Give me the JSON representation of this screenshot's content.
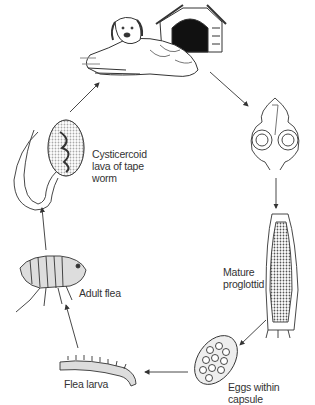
{
  "stages": {
    "dog": {
      "icon": "dog-with-kennel-icon"
    },
    "scolex": {
      "icon": "tapeworm-scolex-icon"
    },
    "proglottid": {
      "label": "Mature proglottid",
      "line1": "Mature",
      "line2": "proglottid",
      "icon": "proglottid-icon"
    },
    "eggs": {
      "label": "Eggs within capsule",
      "icon": "egg-capsule-icon"
    },
    "larva": {
      "label": "Flea larva",
      "icon": "flea-larva-icon"
    },
    "flea": {
      "label": "Adult flea",
      "icon": "adult-flea-icon"
    },
    "cysticercoid": {
      "label": "Cysticercoid lava of tape worm",
      "line1": "Cysticercoid",
      "line2": "lava of tape",
      "line3": "worm",
      "icon": "cysticercoid-icon"
    }
  },
  "colors": {
    "ink": "#333333",
    "shade": "#666666",
    "background": "#ffffff"
  }
}
